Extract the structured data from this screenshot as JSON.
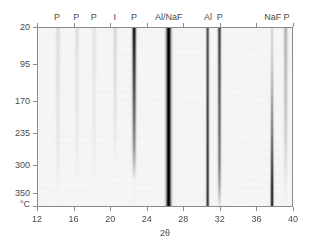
{
  "figure": {
    "title": "",
    "xaxis_title": "2θ",
    "yaxis_unit": "°C"
  },
  "chart_data": {
    "type": "heatmap",
    "title": "",
    "subtitle": "",
    "xlabel": "2θ",
    "ylabel": "",
    "yunit": "°C",
    "colormap": "grayscale-inverted",
    "grid": false,
    "legend": "none",
    "xlim": [
      12,
      40
    ],
    "ylim": [
      20,
      360
    ],
    "xticks": [
      12,
      16,
      20,
      24,
      28,
      32,
      36,
      40
    ],
    "xtick_labels": [
      "12",
      "16",
      "20",
      "24",
      "28",
      "32",
      "36",
      "40"
    ],
    "yticks": [
      20,
      95,
      170,
      235,
      300,
      350
    ],
    "ytick_labels": [
      "20",
      "95",
      "170",
      "235",
      "300",
      "350"
    ],
    "ytick_fracs": [
      0.0,
      0.2056,
      0.4111,
      0.5889,
      0.7667,
      0.9222
    ],
    "phase_labels": [
      {
        "text": "P",
        "two_theta": 14.2,
        "x_frac": 0.0786
      },
      {
        "text": "P",
        "two_theta": 16.3,
        "x_frac": 0.1536
      },
      {
        "text": "P",
        "two_theta": 18.2,
        "x_frac": 0.2214
      },
      {
        "text": "I",
        "two_theta": 20.5,
        "x_frac": 0.3036
      },
      {
        "text": "P",
        "two_theta": 22.6,
        "x_frac": 0.3786
      },
      {
        "text": "Al/NaF",
        "two_theta": 26.4,
        "x_frac": 0.5143
      },
      {
        "text": "Al",
        "two_theta": 30.7,
        "x_frac": 0.6679
      },
      {
        "text": "P",
        "two_theta": 32.0,
        "x_frac": 0.7143
      },
      {
        "text": "NaF",
        "two_theta": 37.8,
        "x_frac": 0.9214
      },
      {
        "text": "P",
        "two_theta": 39.3,
        "x_frac": 0.975
      }
    ],
    "reflections": [
      {
        "phase": "P",
        "two_theta": 14.2,
        "width": 0.3,
        "intensity_top": 0.07,
        "intensity_bottom": 0.02,
        "fade_start": 0.55,
        "fade_end": 0.95
      },
      {
        "phase": "P",
        "two_theta": 16.3,
        "width": 0.28,
        "intensity_top": 0.06,
        "intensity_bottom": 0.01,
        "fade_start": 0.55,
        "fade_end": 0.9
      },
      {
        "phase": "P",
        "two_theta": 18.2,
        "width": 0.28,
        "intensity_top": 0.05,
        "intensity_bottom": 0.01,
        "fade_start": 0.55,
        "fade_end": 0.9
      },
      {
        "phase": "I",
        "two_theta": 20.5,
        "width": 0.25,
        "intensity_top": 0.09,
        "intensity_bottom": 0.0,
        "fade_start": 0.45,
        "fade_end": 0.8
      },
      {
        "phase": "P",
        "two_theta": 22.6,
        "width": 0.26,
        "intensity_top": 0.92,
        "intensity_bottom": 0.05,
        "fade_start": 0.62,
        "fade_end": 0.86
      },
      {
        "phase": "Al/NaF",
        "two_theta": 26.4,
        "width": 0.34,
        "intensity_top": 1.0,
        "intensity_bottom": 1.0,
        "fade_start": 1.0,
        "fade_end": 1.0
      },
      {
        "phase": "Al",
        "two_theta": 30.7,
        "width": 0.2,
        "intensity_top": 0.62,
        "intensity_bottom": 0.72,
        "fade_start": 1.0,
        "fade_end": 1.0
      },
      {
        "phase": "P",
        "two_theta": 32.0,
        "width": 0.22,
        "intensity_top": 0.7,
        "intensity_bottom": 0.34,
        "fade_start": 0.72,
        "fade_end": 1.0
      },
      {
        "phase": "NaF",
        "two_theta": 37.8,
        "width": 0.2,
        "intensity_top": 0.1,
        "intensity_bottom": 0.86,
        "fade_start": 0.0,
        "fade_end": 0.0,
        "grow": true
      },
      {
        "phase": "P",
        "two_theta": 39.3,
        "width": 0.26,
        "intensity_top": 0.22,
        "intensity_bottom": 0.05,
        "fade_start": 0.45,
        "fade_end": 0.95
      }
    ],
    "background_level": 0.015
  }
}
